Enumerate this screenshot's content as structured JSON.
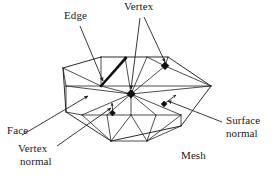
{
  "figure": {
    "background_color": "#ffffff",
    "line_color": "#231f20",
    "text_color": "#1a1a1a"
  },
  "labels": {
    "edge": "Edge",
    "vertex": "Vertex",
    "face": "Face",
    "vertex_normal_line1": "Vertex",
    "vertex_normal_line2": "normal",
    "surface_normal_line1": "Surface",
    "surface_normal_line2": "normal",
    "mesh": "Mesh"
  },
  "diagram": {
    "mesh_shape": "hexagonal triangulated patch in oblique perspective",
    "vertex_markers": 2,
    "highlighted_edge": true,
    "normal_arrows": 2,
    "leader_lines": 6,
    "mesh_outline": [
      [
        63,
        68
      ],
      [
        101,
        57
      ],
      [
        168,
        57
      ],
      [
        211,
        86
      ],
      [
        181,
        126
      ],
      [
        111,
        141
      ],
      [
        66,
        112
      ]
    ],
    "center_vertex": [
      131,
      94
    ],
    "upper_right_vertex": [
      165,
      66
    ],
    "bold_edge": [
      [
        101,
        86
      ],
      [
        125,
        59
      ]
    ]
  }
}
